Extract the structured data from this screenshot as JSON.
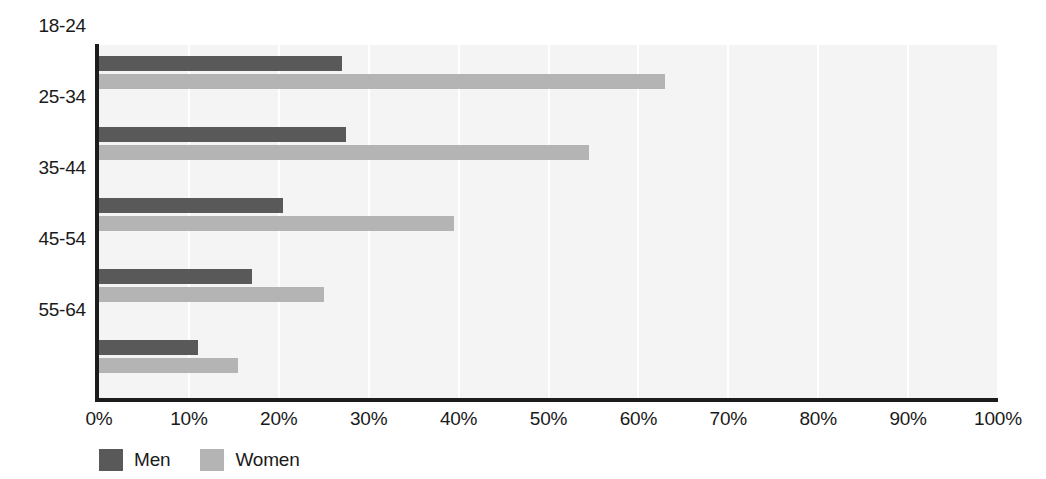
{
  "chart_data": {
    "type": "bar",
    "orientation": "horizontal",
    "title": "",
    "subtitle": "",
    "xlabel": "",
    "ylabel": "",
    "categories": [
      "18-24",
      "25-34",
      "35-44",
      "45-54",
      "55-64"
    ],
    "series": [
      {
        "name": "Men",
        "color": "#595959",
        "values": [
          27,
          27.5,
          20.5,
          17,
          11
        ]
      },
      {
        "name": "Women",
        "color": "#b4b4b4",
        "values": [
          63,
          54.5,
          39.5,
          25,
          15.5
        ]
      }
    ],
    "xlim": [
      0,
      100
    ],
    "xticks": [
      0,
      10,
      20,
      30,
      40,
      50,
      60,
      70,
      80,
      90,
      100
    ],
    "xtick_labels": [
      "0%",
      "10%",
      "20%",
      "30%",
      "40%",
      "50%",
      "60%",
      "70%",
      "80%",
      "90%",
      "100%"
    ],
    "grid": true,
    "grid_axis": "x",
    "legend": [
      "Men",
      "Women"
    ],
    "legend_position": "bottom-left",
    "plot_background": "#f4f4f4",
    "gridline_color": "#ffffff",
    "axis_color": "#1c1c1c"
  }
}
